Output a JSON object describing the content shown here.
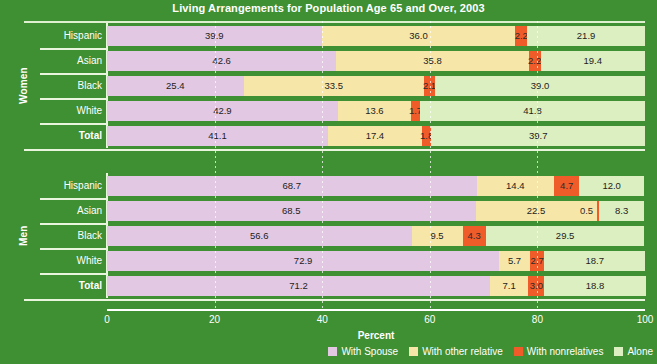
{
  "chart_data": {
    "type": "bar",
    "subtype": "stacked-horizontal-100",
    "title": "Living Arrangements for Population Age 65 and Over, 2003",
    "xlabel": "Percent",
    "ylabel": "",
    "xlim": [
      0,
      100
    ],
    "xticks": [
      0,
      20,
      40,
      60,
      80,
      100
    ],
    "grid": true,
    "legend_position": "bottom-right",
    "series": [
      {
        "name": "With Spouse",
        "color": "#e2c8e2"
      },
      {
        "name": "With other relative",
        "color": "#f6e6a8"
      },
      {
        "name": "With nonrelatives",
        "color": "#f05b2a"
      },
      {
        "name": "Alone",
        "color": "#dcefc0"
      }
    ],
    "groups": [
      {
        "name": "Women",
        "rows": [
          {
            "category": "Hispanic",
            "total": false,
            "values": [
              39.9,
              36.0,
              2.2,
              21.9
            ]
          },
          {
            "category": "Asian",
            "total": false,
            "values": [
              42.6,
              35.8,
              2.2,
              19.4
            ]
          },
          {
            "category": "Black",
            "total": false,
            "values": [
              25.4,
              33.5,
              2.1,
              39.0
            ]
          },
          {
            "category": "White",
            "total": false,
            "values": [
              42.9,
              13.6,
              1.7,
              41.8
            ]
          },
          {
            "category": "Total",
            "total": true,
            "values": [
              41.1,
              17.4,
              1.8,
              39.7
            ]
          }
        ]
      },
      {
        "name": "Men",
        "rows": [
          {
            "category": "Hispanic",
            "total": false,
            "values": [
              68.7,
              14.4,
              4.7,
              12.0
            ]
          },
          {
            "category": "Asian",
            "total": false,
            "values": [
              68.5,
              22.5,
              0.5,
              8.3
            ]
          },
          {
            "category": "Black",
            "total": false,
            "values": [
              56.6,
              9.5,
              4.3,
              29.5
            ]
          },
          {
            "category": "White",
            "total": false,
            "values": [
              72.9,
              5.7,
              2.7,
              18.7
            ]
          },
          {
            "category": "Total",
            "total": true,
            "values": [
              71.2,
              7.1,
              3.0,
              18.8
            ]
          }
        ]
      }
    ]
  },
  "colors": {
    "background": "#3f8f33",
    "rule": "#eaf5de",
    "axis": "#ffffff",
    "text": "#ffffff",
    "value_text": "#1d1d1d"
  }
}
